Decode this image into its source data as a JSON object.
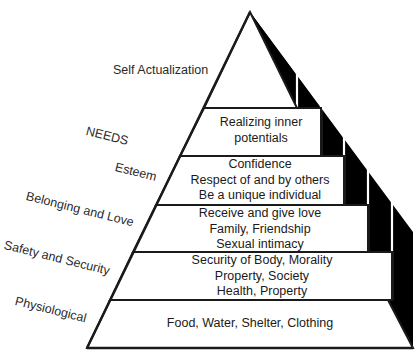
{
  "diagram": {
    "type": "pyramid",
    "side_labels": [
      {
        "id": "self-actualization",
        "text": "Self Actualization"
      },
      {
        "id": "needs",
        "text": "NEEDS"
      },
      {
        "id": "esteem",
        "text": "Esteem"
      },
      {
        "id": "belonging",
        "text": "Belonging and Love"
      },
      {
        "id": "safety",
        "text": "Safety and Security"
      },
      {
        "id": "physiological",
        "text": "Physiological"
      }
    ],
    "tiers": [
      {
        "level": "Self Actualization (apex)",
        "lines": []
      },
      {
        "level": "Self Actualization",
        "lines": [
          "Realizing inner",
          "potentials"
        ]
      },
      {
        "level": "Esteem",
        "lines": [
          "Confidence",
          "Respect of and by others",
          "Be a unique individual"
        ]
      },
      {
        "level": "Belonging and Love",
        "lines": [
          "Receive and give love",
          "Family, Friendship",
          "Sexual intimacy"
        ]
      },
      {
        "level": "Safety and Security",
        "lines": [
          "Security of Body, Morality",
          "Property, Society",
          "Health, Property"
        ]
      },
      {
        "level": "Physiological",
        "lines": [
          "Food, Water, Shelter, Clothing"
        ]
      }
    ],
    "colors": {
      "outline": "#1a1a1a",
      "shadow": "#000000",
      "fill": "#ffffff",
      "text": "#1a1a1a"
    }
  }
}
